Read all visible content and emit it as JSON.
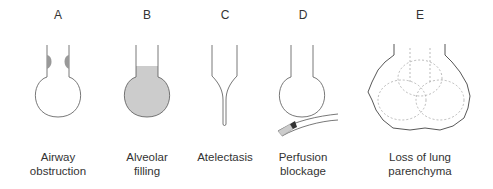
{
  "panels": [
    {
      "letter": "A",
      "caption_line1": "Airway",
      "caption_line2": "obstruction"
    },
    {
      "letter": "B",
      "caption_line1": "Alveolar",
      "caption_line2": "filling"
    },
    {
      "letter": "C",
      "caption_line1": "Atelectasis",
      "caption_line2": ""
    },
    {
      "letter": "D",
      "caption_line1": "Perfusion",
      "caption_line2": "blockage"
    },
    {
      "letter": "E",
      "caption_line1": "Loss of lung",
      "caption_line2": "parenchyma"
    }
  ],
  "colors": {
    "line": "#555555",
    "obstruction_fill": "#999999",
    "alveolar_fill": "#cccccc",
    "clot_fill": "#333333",
    "dashed": "#aaaaaa"
  }
}
